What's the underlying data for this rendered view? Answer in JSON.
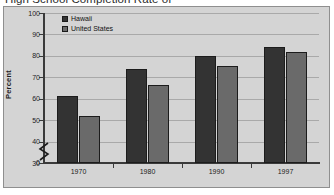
{
  "title": "High School Completion Rate of",
  "colors": {
    "hawaii": "#333333",
    "united_states": "#6a6a6a",
    "plot_background": "#d4d4d4",
    "frame_border": "#8f8f8f",
    "gridline": "#a9a9a9",
    "axis": "#3a3a3a",
    "text": "#1c1c1c"
  },
  "axis": {
    "ylabel": "Percent",
    "yticks": [
      "100",
      "90",
      "80",
      "70",
      "60",
      "50",
      "40",
      "30",
      "0"
    ],
    "break_marker": "zigzag"
  },
  "legend": {
    "items": [
      {
        "label": "Hawaii",
        "color": "#333333"
      },
      {
        "label": "United States",
        "color": "#6a6a6a"
      }
    ]
  },
  "chart_data": {
    "type": "bar",
    "title": "High School Completion Rate of",
    "xlabel": "",
    "ylabel": "Percent",
    "categories": [
      "1970",
      "1980",
      "1990",
      "1997"
    ],
    "series": [
      {
        "name": "Hawaii",
        "color": "#333333",
        "values": [
          61.5,
          74.0,
          80.0,
          84.0
        ]
      },
      {
        "name": "United States",
        "color": "#6a6a6a",
        "values": [
          52.0,
          66.5,
          75.5,
          82.0
        ]
      }
    ],
    "ylim": [
      30,
      100
    ],
    "ytick_values": [
      30,
      40,
      50,
      60,
      70,
      80,
      90,
      100
    ],
    "y_axis_break": {
      "from": 0,
      "to": 30
    },
    "grid": true,
    "legend_position": "top-left",
    "units": "percent"
  }
}
